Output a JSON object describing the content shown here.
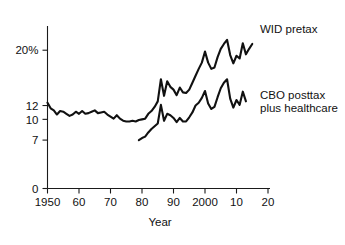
{
  "chart_data": {
    "type": "line",
    "title": "",
    "subtitle": "",
    "xlabel": "Year",
    "ylabel": "",
    "xlim": [
      1950,
      2020
    ],
    "ylim": [
      0,
      23.5
    ],
    "grid": false,
    "legend_position": "inline-right",
    "x_ticks": [
      1950,
      1960,
      1970,
      1980,
      1990,
      2000,
      2010,
      2020
    ],
    "x_tick_labels": [
      "1950",
      "60",
      "70",
      "80",
      "90",
      "2000",
      "10",
      "20"
    ],
    "y_ticks": [
      0,
      7,
      10,
      12,
      20
    ],
    "y_tick_labels": [
      "0",
      "7",
      "10",
      "12",
      "20%"
    ],
    "series": [
      {
        "name": "WID pretax",
        "label": "WID pretax",
        "label_line_1": "WID pretax",
        "label_line_2": "",
        "color": "#111111",
        "x": [
          1950,
          1951,
          1952,
          1953,
          1954,
          1955,
          1956,
          1957,
          1958,
          1959,
          1960,
          1961,
          1962,
          1963,
          1964,
          1965,
          1966,
          1967,
          1968,
          1969,
          1970,
          1971,
          1972,
          1973,
          1974,
          1975,
          1976,
          1977,
          1978,
          1979,
          1980,
          1981,
          1982,
          1983,
          1984,
          1985,
          1986,
          1987,
          1988,
          1989,
          1990,
          1991,
          1992,
          1993,
          1994,
          1995,
          1996,
          1997,
          1998,
          1999,
          2000,
          2001,
          2002,
          2003,
          2004,
          2005,
          2006,
          2007,
          2008,
          2009,
          2010,
          2011,
          2012,
          2013,
          2014,
          2015
        ],
        "values": [
          12.4,
          11.6,
          11.3,
          10.7,
          11.2,
          11.1,
          10.8,
          10.5,
          10.7,
          11.1,
          10.8,
          11.2,
          10.8,
          10.9,
          11.1,
          11.3,
          10.9,
          11.0,
          11.1,
          10.7,
          10.4,
          10.1,
          10.6,
          10.1,
          9.8,
          9.7,
          9.7,
          9.8,
          9.7,
          9.9,
          10.0,
          10.1,
          10.8,
          11.2,
          11.8,
          12.6,
          15.8,
          13.4,
          15.5,
          14.7,
          14.3,
          13.5,
          14.6,
          13.9,
          13.8,
          14.3,
          15.3,
          16.3,
          17.3,
          18.2,
          19.8,
          18.2,
          17.3,
          17.5,
          19.0,
          20.2,
          20.9,
          21.5,
          19.3,
          18.1,
          19.2,
          18.8,
          21.0,
          19.4,
          20.2,
          20.9
        ]
      },
      {
        "name": "CBO posttax plus healthcare",
        "label": "CBO posttax plus healthcare",
        "label_line_1": "CBO posttax",
        "label_line_2": "plus healthcare",
        "color": "#111111",
        "x": [
          1979,
          1980,
          1981,
          1982,
          1983,
          1984,
          1985,
          1986,
          1987,
          1988,
          1989,
          1990,
          1991,
          1992,
          1993,
          1994,
          1995,
          1996,
          1997,
          1998,
          1999,
          2000,
          2001,
          2002,
          2003,
          2004,
          2005,
          2006,
          2007,
          2008,
          2009,
          2010,
          2011,
          2012,
          2013
        ],
        "values": [
          7.0,
          7.3,
          7.5,
          8.1,
          8.6,
          9.0,
          9.4,
          12.1,
          9.8,
          10.8,
          10.6,
          10.2,
          9.6,
          10.2,
          9.7,
          9.7,
          10.3,
          11.0,
          12.0,
          12.4,
          13.1,
          14.1,
          12.3,
          11.5,
          11.8,
          13.2,
          14.5,
          15.3,
          15.8,
          13.0,
          11.7,
          12.8,
          12.1,
          14.0,
          12.6
        ]
      }
    ]
  },
  "labels": {
    "x_axis_title": "Year",
    "series_1_label": "WID pretax",
    "series_2_label_line1": "CBO posttax",
    "series_2_label_line2": "plus healthcare"
  }
}
